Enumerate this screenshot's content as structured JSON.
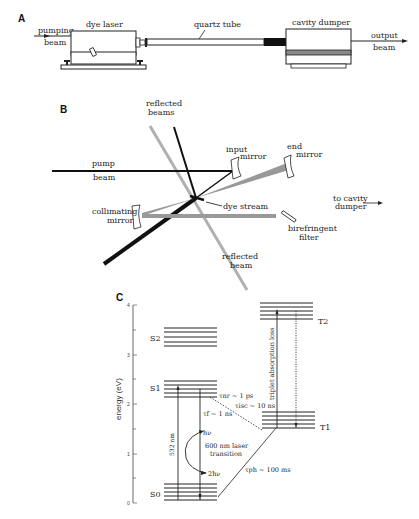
{
  "panels": {
    "A": {
      "label": "A",
      "pumping_beam": [
        "pumping",
        "beam"
      ],
      "dye_laser": "dye laser",
      "quartz_tube": "quartz tube",
      "cavity_dumper": "cavity dumper",
      "output_beam": [
        "output",
        "beam"
      ]
    },
    "B": {
      "label": "B",
      "reflected_beams": [
        "reflected",
        "beams"
      ],
      "pump_beam": [
        "pump",
        "beam"
      ],
      "input_mirror": [
        "input",
        "mirror"
      ],
      "end_mirror": [
        "end",
        "mirror"
      ],
      "dye_stream": "dye stream",
      "to_cavity_dumper": [
        "to cavity",
        "dumper"
      ],
      "collimating_mirror": [
        "collimating",
        "mirror"
      ],
      "birefringent_filter": [
        "birefringent",
        "filter"
      ],
      "reflected_beam": [
        "reflected",
        "beam"
      ]
    },
    "C": {
      "label": "C",
      "y_axis_label": "energy (eV)",
      "y_ticks": [
        "4",
        "3",
        "2",
        "1",
        "0"
      ],
      "levels": {
        "S2": "S2",
        "S1": "S1",
        "S0": "S0",
        "T1": "T1",
        "T2": "T2"
      },
      "annotations": {
        "pump_532": "532 nm",
        "tau_nr": "τnr ~ 1 ps",
        "tau_isc": "τisc ~ 10 ns",
        "tau_f": "τf ~ 1 ns",
        "hv": "hν",
        "laser_transition": [
          "600 nm laser",
          "transition"
        ],
        "two_hv": "2hν",
        "tau_ph": "τph ~ 100 ms",
        "triplet_loss": "triplet absorption loss"
      }
    }
  },
  "colors": {
    "ink": "#222222",
    "gray_beam": "#a8a8a8",
    "dark_gray_beam": "#8a8a8a",
    "black_block": "#111111"
  }
}
